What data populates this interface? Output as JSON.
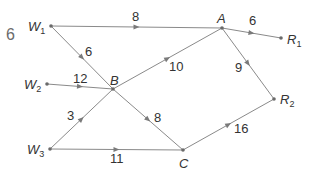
{
  "question_number": "6",
  "colors": {
    "edge": "#8a8a8a",
    "node": "#6a6a6a",
    "text": "#333333",
    "question_number": "#6b6b6b"
  },
  "nodes": [
    {
      "id": "W1",
      "label": "W",
      "sub": "1",
      "x": 51,
      "y": 26,
      "lx": 28,
      "ly": 31
    },
    {
      "id": "W2",
      "label": "W",
      "sub": "2",
      "x": 47,
      "y": 84,
      "lx": 24,
      "ly": 89
    },
    {
      "id": "W3",
      "label": "W",
      "sub": "3",
      "x": 50,
      "y": 149,
      "lx": 27,
      "ly": 154
    },
    {
      "id": "A",
      "label": "A",
      "sub": "",
      "x": 222,
      "y": 28,
      "lx": 217,
      "ly": 23
    },
    {
      "id": "B",
      "label": "B",
      "sub": "",
      "x": 113,
      "y": 89,
      "lx": 110,
      "ly": 85
    },
    {
      "id": "C",
      "label": "C",
      "sub": "",
      "x": 183,
      "y": 150,
      "lx": 179,
      "ly": 168
    },
    {
      "id": "R1",
      "label": "R",
      "sub": "1",
      "x": 281,
      "y": 38,
      "lx": 287,
      "ly": 44
    },
    {
      "id": "R2",
      "label": "R",
      "sub": "2",
      "x": 274,
      "y": 99,
      "lx": 280,
      "ly": 104
    }
  ],
  "edges": [
    {
      "from": "W1",
      "to": "A",
      "weight": "8",
      "wx": 132,
      "wy": 21
    },
    {
      "from": "W1",
      "to": "B",
      "weight": "6",
      "wx": 85,
      "wy": 56
    },
    {
      "from": "W2",
      "to": "B",
      "weight": "12",
      "wx": 73,
      "wy": 83
    },
    {
      "from": "W3",
      "to": "B",
      "weight": "3",
      "wx": 67,
      "wy": 120
    },
    {
      "from": "W3",
      "to": "C",
      "weight": "11",
      "wx": 110,
      "wy": 163
    },
    {
      "from": "B",
      "to": "A",
      "weight": "10",
      "wx": 169,
      "wy": 71
    },
    {
      "from": "B",
      "to": "C",
      "weight": "8",
      "wx": 154,
      "wy": 122
    },
    {
      "from": "A",
      "to": "R1",
      "weight": "6",
      "wx": 249,
      "wy": 25
    },
    {
      "from": "A",
      "to": "R2",
      "weight": "9",
      "wx": 235,
      "wy": 72
    },
    {
      "from": "C",
      "to": "R2",
      "weight": "16",
      "wx": 234,
      "wy": 133
    }
  ]
}
